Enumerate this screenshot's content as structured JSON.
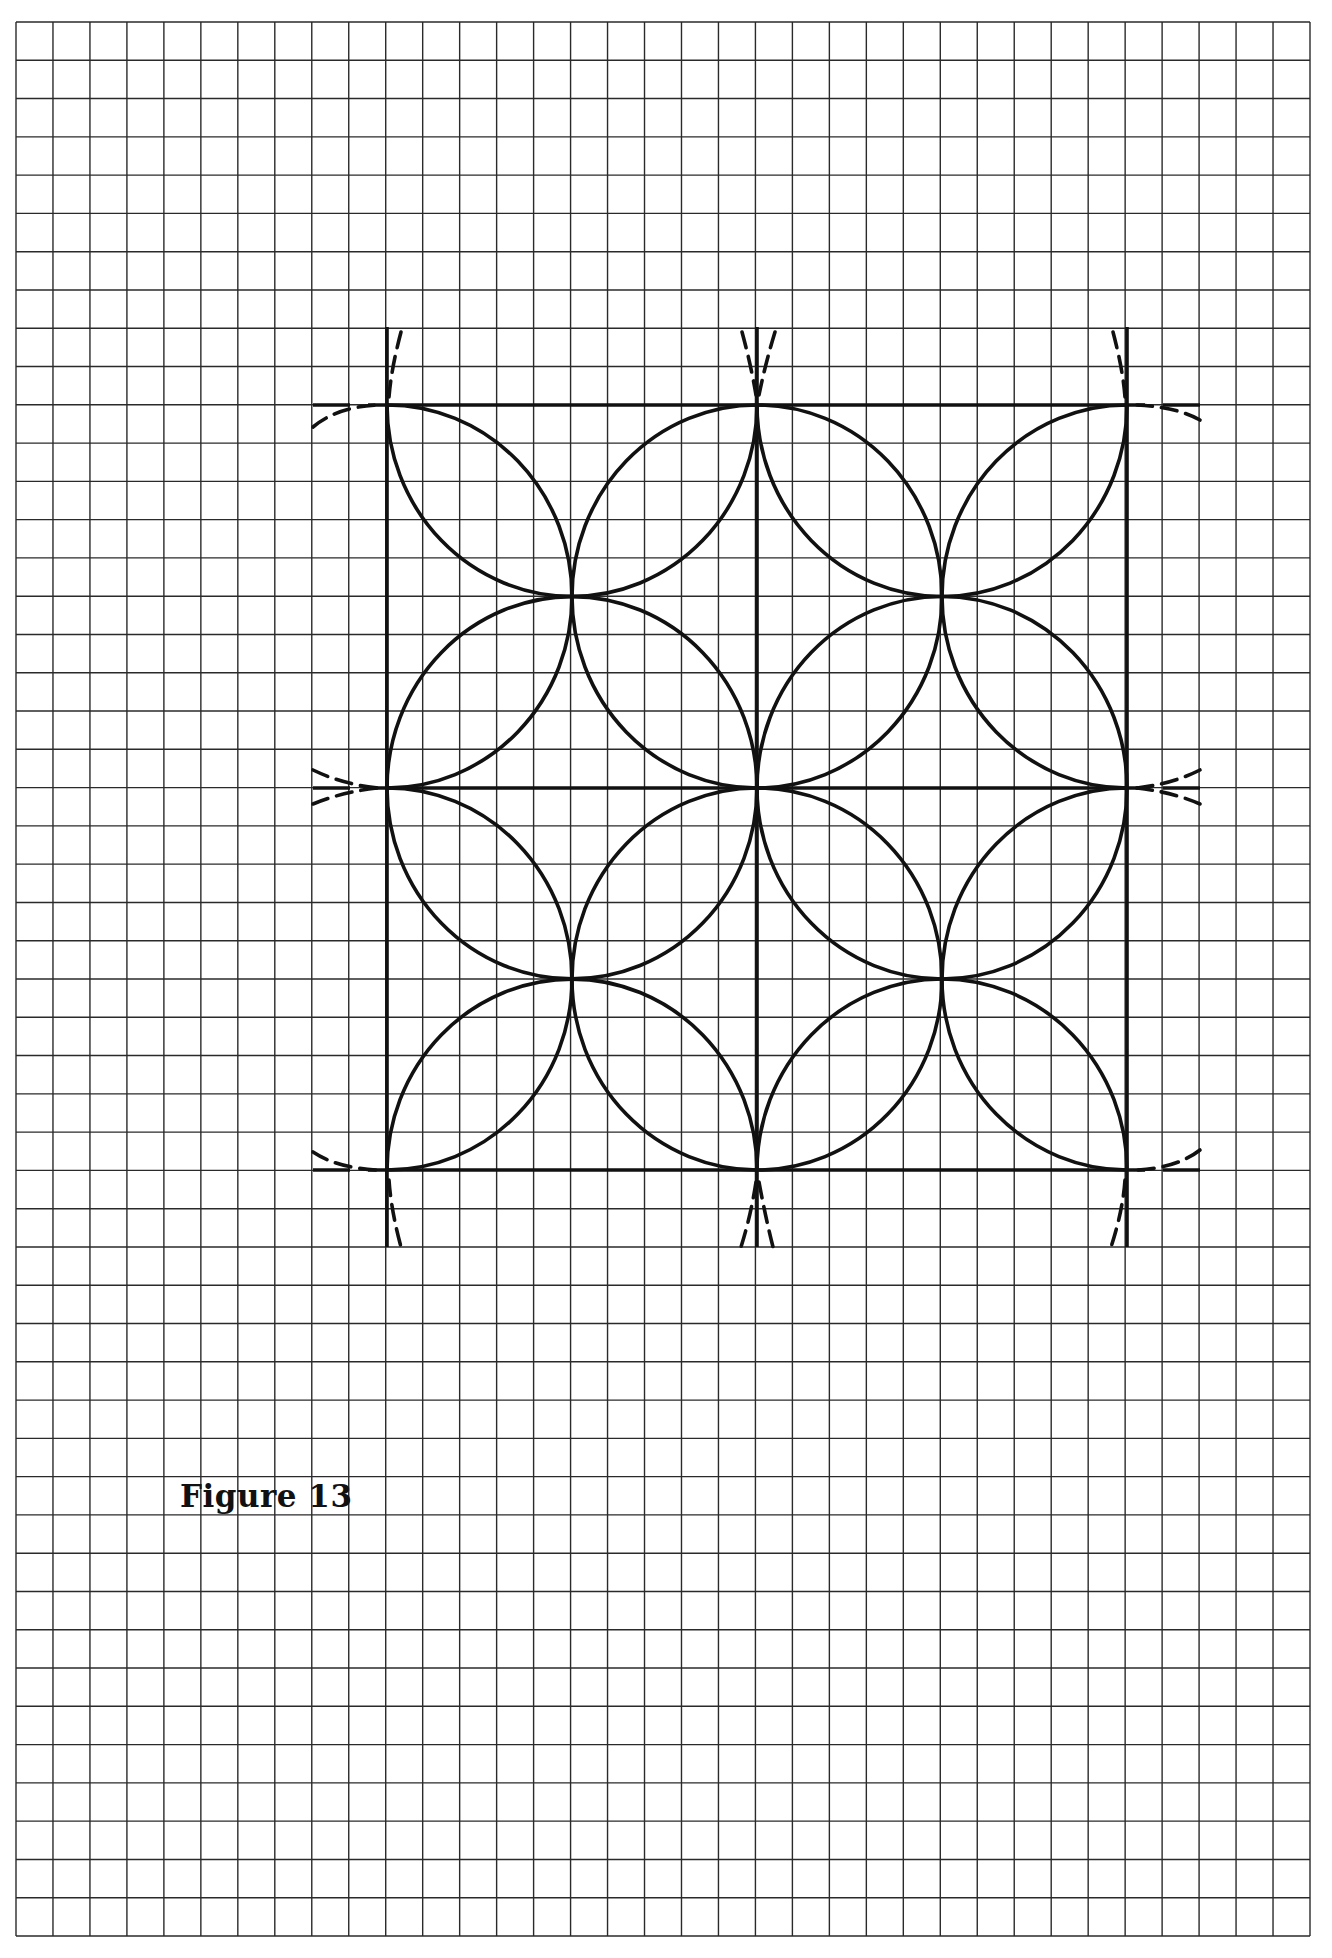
{
  "page": {
    "width": 1332,
    "height": 1958,
    "background": "#ffffff"
  },
  "grid": {
    "left": 16,
    "top": 22,
    "right": 1310,
    "bottom": 1936,
    "columns": 35,
    "rows": 50,
    "line_color": "#2a2a2a",
    "line_width": 1.4
  },
  "figure": {
    "title": "Figure 13",
    "caption_position": {
      "x": 180,
      "y": 1478
    },
    "ink_color": "#111111",
    "stroke_width": 3.6,
    "square": {
      "left": 387,
      "right": 1127,
      "top": 405,
      "bottom": 1170
    },
    "midlines": {
      "x": 757,
      "y": 788
    },
    "line_extent": {
      "x_min": 313,
      "x_max": 1200,
      "y_min": 327,
      "y_max": 1247
    },
    "pattern": "Square divided into four quadrants; on every quadrant edge a semicircular arc is drawn centred on the edge midpoint, bulging into the quadrant, so that all four arcs in each quadrant meet at the quadrant centre, forming an interlocking circle (petal) pattern.",
    "construction_marks": "Dashed compass arcs drawn outside the square at each corner and edge midpoint"
  }
}
